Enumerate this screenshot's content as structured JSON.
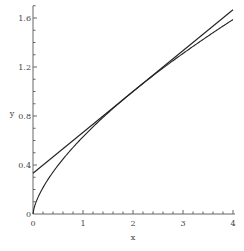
{
  "chart_data": {
    "type": "line",
    "title": "",
    "xlabel": "x",
    "ylabel": "y",
    "xlim": [
      0,
      4
    ],
    "ylim": [
      0,
      1.7
    ],
    "x_ticks": [
      "0",
      "1",
      "2",
      "3",
      "4"
    ],
    "y_ticks": [
      "0",
      "0.4",
      "0.8",
      "1.2",
      "1.6"
    ],
    "y_tick_values": [
      0,
      0.4,
      0.8,
      1.2,
      1.6
    ],
    "x_tick_values": [
      0,
      1,
      2,
      3,
      4
    ],
    "grid": false,
    "legend": null,
    "series": [
      {
        "name": "curve",
        "description": "concave curve from origin, y ≈ (x/2)^(2/3)",
        "x": [
          0,
          0.05,
          0.25,
          0.5,
          1,
          1.5,
          2,
          2.5,
          3,
          3.5,
          4
        ],
        "values": [
          0,
          0.09,
          0.25,
          0.4,
          0.63,
          0.83,
          1.0,
          1.16,
          1.31,
          1.45,
          1.59
        ]
      },
      {
        "name": "tangent line",
        "description": "straight line tangent at x=2, y = 1/3 + x/3",
        "x": [
          0,
          4
        ],
        "values": [
          0.333,
          1.667
        ]
      }
    ]
  }
}
